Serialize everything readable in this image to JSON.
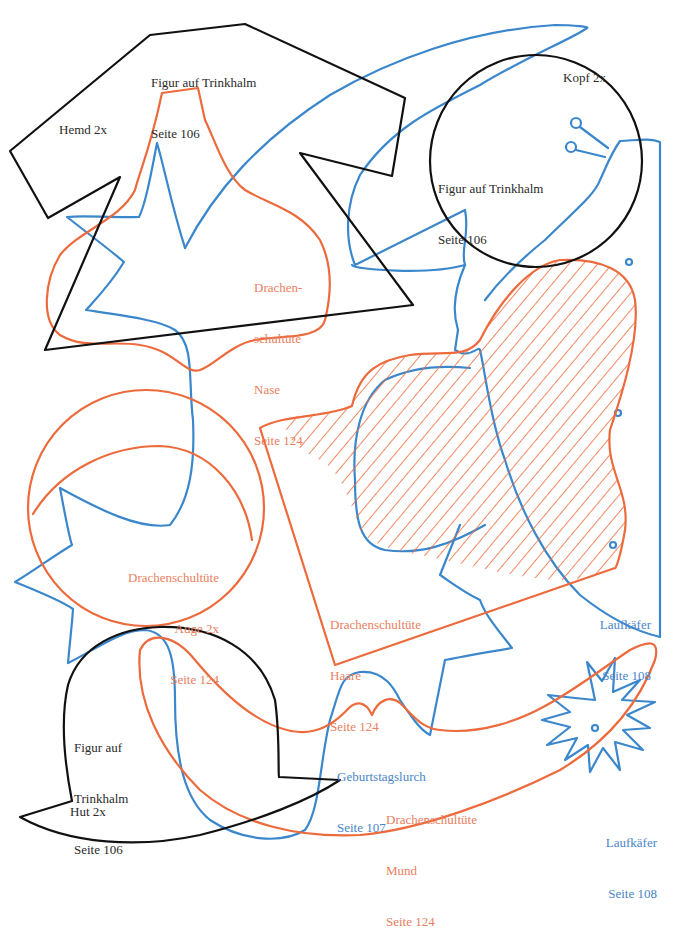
{
  "colors": {
    "black_outline": "#111111",
    "orange_outline": "#ec6a3c",
    "blue_outline": "#3b87cc",
    "orange_text": "#e9805e",
    "blue_text": "#4a86c8",
    "black_text": "#2b2b2b"
  },
  "labels": {
    "hemd": {
      "title": "Figur auf Trinkhalm",
      "page": "Seite 106",
      "part": "Hemd 2x"
    },
    "kopf": {
      "part": "Kopf 2x",
      "title": "Figur auf Trinkhalm",
      "page": "Seite 106"
    },
    "nase": {
      "line1": "Drachen-",
      "line2": "schultüte",
      "part": "Nase",
      "page": "Seite 124"
    },
    "auge": {
      "title": "Drachenschultüte",
      "part": "Auge 2x",
      "page": "Seite 124"
    },
    "haare": {
      "title": "Drachenschultüte",
      "part": "Haare",
      "page": "Seite 124"
    },
    "laufkaefer_top": {
      "title": "Laufkäfer",
      "page": "Seite 108"
    },
    "hut": {
      "line1": "Figur auf",
      "line2": "Trinkhalm",
      "page": "Seite 106",
      "part": "Hut 2x"
    },
    "lurch": {
      "title": "Geburtstagslurch",
      "page": "Seite 107"
    },
    "mund": {
      "title": "Drachenschultüte",
      "part": "Mund",
      "page": "Seite 124"
    },
    "laufkaefer_bottom": {
      "title": "Laufkäfer",
      "page": "Seite 108"
    }
  }
}
